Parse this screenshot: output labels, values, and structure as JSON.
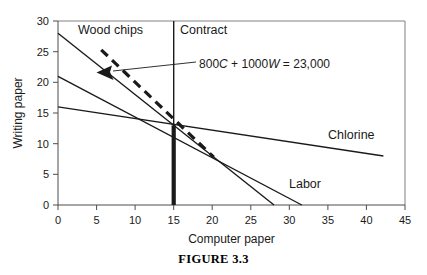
{
  "figure": {
    "caption": "FIGURE 3.3"
  },
  "chart_data": {
    "type": "line",
    "title": "",
    "xlabel": "Computer paper",
    "ylabel": "Writing paper",
    "xlim": [
      0,
      45
    ],
    "ylim": [
      0,
      30
    ],
    "xticks": [
      0,
      5,
      10,
      15,
      20,
      25,
      30,
      35,
      40,
      45
    ],
    "yticks": [
      0,
      5,
      10,
      15,
      20,
      25,
      30
    ],
    "grid": false,
    "legend_position": "inline-labels",
    "annotations": [
      {
        "name": "isoprofit-equation",
        "text": "800C + 1000W = 23,000",
        "italic_parts": [
          "C",
          "W"
        ],
        "x": 19.5,
        "y": 22.5
      }
    ],
    "series": [
      {
        "name": "Wood chips",
        "label": "Wood chips",
        "label_x": 5.2,
        "label_y": 27.4,
        "x": [
          0,
          28.0
        ],
        "values": [
          28.0,
          0.0
        ],
        "style": "solid"
      },
      {
        "name": "Labor",
        "label": "Labor",
        "label_x": 30.0,
        "label_y": 3.6,
        "x": [
          0,
          31.6
        ],
        "values": [
          21.0,
          0.0
        ],
        "style": "solid"
      },
      {
        "name": "Chlorine",
        "label": "Chlorine",
        "label_x": 35.0,
        "label_y": 11.6,
        "x": [
          0,
          42.2
        ],
        "values": [
          16.0,
          8.0
        ],
        "style": "solid"
      },
      {
        "name": "Contract",
        "label": "Contract",
        "label_x": 16.0,
        "label_y": 28.2,
        "x": [
          15.0,
          15.0
        ],
        "values": [
          30.0,
          0.0
        ],
        "style": "vertical-solid-thick-below-13"
      },
      {
        "name": "Isoprofit",
        "label": "",
        "label_x": 0,
        "label_y": 0,
        "x": [
          5.6,
          20.2
        ],
        "values": [
          25.3,
          7.8
        ],
        "style": "dashed-with-arrow"
      }
    ],
    "intersection_point": {
      "x": 15.0,
      "y": 13.0
    }
  }
}
